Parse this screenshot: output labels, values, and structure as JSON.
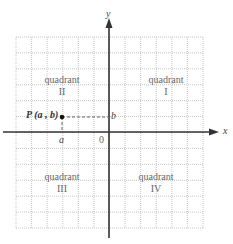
{
  "diagram": {
    "axes": {
      "x_label": "x",
      "y_label": "y",
      "origin_label": "0"
    },
    "grid": {
      "columns": 12,
      "rows": 12,
      "style": "dotted"
    },
    "point": {
      "label": "P (a , b)",
      "x_label": "a",
      "y_label": "b"
    },
    "quadrants": [
      {
        "name": "quadrant",
        "numeral": "I"
      },
      {
        "name": "quadrant",
        "numeral": "II"
      },
      {
        "name": "quadrant",
        "numeral": "III"
      },
      {
        "name": "quadrant",
        "numeral": "IV"
      }
    ],
    "colors": {
      "grid": "#b8b8b8",
      "axis": "#333333",
      "dashed": "#666666",
      "point": "#111111",
      "text": "#555555"
    }
  }
}
